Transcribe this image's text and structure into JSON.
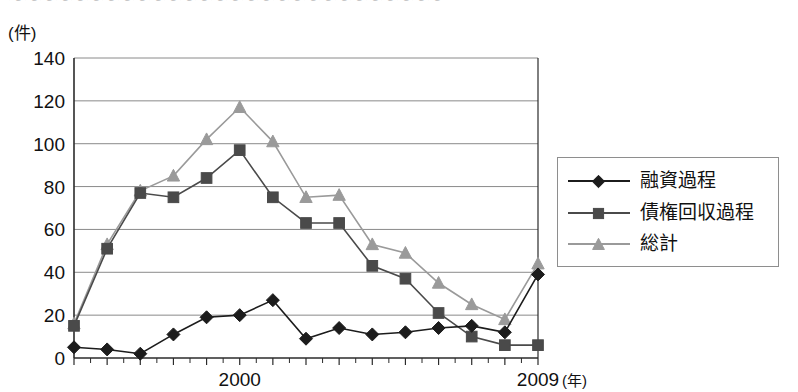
{
  "title_partial": "〜〜〜〜〜〜〜〜〜〜〜〜〜〜〜〜〜〜〜〜〜〜〜〜〜〜〜〜",
  "axes": {
    "y_unit_label": "(件)",
    "x_unit_label": "(年)",
    "y_ticks": [
      "0",
      "20",
      "40",
      "60",
      "80",
      "100",
      "120",
      "140"
    ],
    "x_labeled_ticks": [
      "2000",
      "2009"
    ]
  },
  "legend": {
    "items": [
      {
        "label": "融資過程",
        "marker": "diamond",
        "color": "#1c1c1c"
      },
      {
        "label": "債権回収過程",
        "marker": "square",
        "color": "#4a4a4a"
      },
      {
        "label": "総計",
        "marker": "triangle",
        "color": "#9a9a9a"
      }
    ]
  },
  "chart_data": {
    "type": "line",
    "title": "",
    "xlabel": "(年)",
    "ylabel": "(件)",
    "ylim": [
      0,
      140
    ],
    "ytick_step": 20,
    "grid": true,
    "legend_position": "right",
    "x": [
      1995,
      1996,
      1997,
      1998,
      1999,
      2000,
      2001,
      2002,
      2003,
      2004,
      2005,
      2006,
      2007,
      2008,
      2009
    ],
    "categories": [
      "1995",
      "1996",
      "1997",
      "1998",
      "1999",
      "2000",
      "2001",
      "2002",
      "2003",
      "2004",
      "2005",
      "2006",
      "2007",
      "2008",
      "2009"
    ],
    "series": [
      {
        "name": "融資過程",
        "marker": "diamond",
        "color": "#1c1c1c",
        "values": [
          5,
          4,
          2,
          11,
          19,
          20,
          27,
          9,
          14,
          11,
          12,
          14,
          15,
          12,
          39
        ]
      },
      {
        "name": "債権回収過程",
        "marker": "square",
        "color": "#4a4a4a",
        "values": [
          15,
          51,
          77,
          75,
          84,
          97,
          75,
          63,
          63,
          43,
          37,
          21,
          10,
          6,
          6
        ]
      },
      {
        "name": "総計",
        "marker": "triangle",
        "color": "#9a9a9a",
        "values": [
          16,
          53,
          78,
          85,
          102,
          117,
          101,
          75,
          76,
          53,
          49,
          35,
          25,
          18,
          44
        ]
      }
    ]
  }
}
